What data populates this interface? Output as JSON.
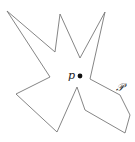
{
  "diagram": {
    "polygon_label": "𝒫",
    "point_label": "p",
    "polygon_points": "7,11 55,52 60,14 80,58 105,12 90,79 120,95 130,115 125,133 85,110 77,87 57,132 16,94 50,77",
    "stroke_color": "#777777",
    "point_color": "#111111"
  }
}
